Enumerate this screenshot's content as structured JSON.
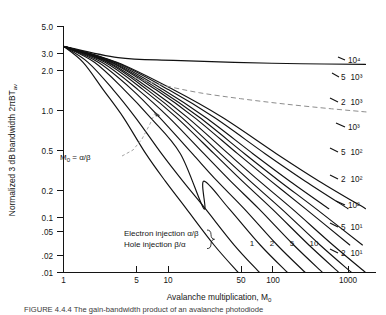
{
  "figure": {
    "caption": "FIGURE 4.4.4   The gain-bandwidth product of an avalanche photodiode",
    "background_color": "#ffffff",
    "ink_color": "#111111",
    "dash_color": "#8d8d8d"
  },
  "chart_data": {
    "type": "line",
    "title": "",
    "xlabel": "Avalanche multiplication, M",
    "xlabel_sub": "0",
    "ylabel": "Normalized 3 dB bandwidth 2πBT",
    "ylabel_sub": "av",
    "xscale": "log",
    "yscale": "log",
    "xlim": [
      1,
      1800
    ],
    "ylim": [
      0.01,
      5.0
    ],
    "grid": false,
    "legend_position": "right-of-curves",
    "xticks": [
      {
        "value": 1,
        "label": "1"
      },
      {
        "value": 5,
        "label": "5"
      },
      {
        "value": 10,
        "label": "10"
      },
      {
        "value": 50,
        "label": "50"
      },
      {
        "value": 100,
        "label": "100"
      },
      {
        "value": 1000,
        "label": "1000"
      }
    ],
    "yticks": [
      {
        "value": 5.0,
        "label": "5.0"
      },
      {
        "value": 3.0,
        "label": "3.0"
      },
      {
        "value": 2.0,
        "label": "2.0"
      },
      {
        "value": 1.0,
        "label": "1.0"
      },
      {
        "value": 0.5,
        "label": "0.5"
      },
      {
        "value": 0.2,
        "label": "0.2"
      },
      {
        "value": 0.1,
        "label": "0.1"
      },
      {
        "value": 0.05,
        "label": ".05"
      },
      {
        "value": 0.02,
        "label": ".02"
      },
      {
        "value": 0.01,
        "label": ".01"
      }
    ],
    "common_origin": {
      "x": 1,
      "y": 3.0
    },
    "series": [
      {
        "name": "k = 1",
        "label_main": "1",
        "label_sup": "",
        "label_position": "bottom",
        "points": [
          [
            1,
            3.0
          ],
          [
            1.6,
            2.0
          ],
          [
            2.6,
            1.0
          ],
          [
            4.2,
            0.5
          ],
          [
            7.2,
            0.2
          ],
          [
            11.5,
            0.1
          ],
          [
            19,
            0.05
          ],
          [
            37,
            0.02
          ],
          [
            66,
            0.01
          ]
        ]
      },
      {
        "name": "k = 2",
        "label_main": "2",
        "label_sup": "",
        "label_position": "bottom",
        "points": [
          [
            1,
            3.0
          ],
          [
            1.8,
            2.0
          ],
          [
            3.3,
            1.0
          ],
          [
            5.6,
            0.5
          ],
          [
            10.5,
            0.2
          ],
          [
            17.5,
            0.1
          ],
          [
            30,
            0.05
          ],
          [
            60,
            0.02
          ],
          [
            110,
            0.01
          ]
        ]
      },
      {
        "name": "k = 5",
        "label_main": "5",
        "label_sup": "",
        "label_position": "bottom",
        "points": [
          [
            1,
            3.0
          ],
          [
            2.1,
            2.0
          ],
          [
            4.3,
            1.0
          ],
          [
            8.0,
            0.5
          ],
          [
            16.5,
            0.2
          ],
          [
            29,
            0.05
          ],
          [
            29,
            0.1
          ],
          [
            53,
            0.05
          ],
          [
            112,
            0.02
          ],
          [
            215,
            0.01
          ]
        ]
      },
      {
        "name": "k = 10",
        "label_main": "10",
        "label_sup": "",
        "label_position": "bottom",
        "points": [
          [
            1,
            3.0
          ],
          [
            2.3,
            2.0
          ],
          [
            5.2,
            1.0
          ],
          [
            10.0,
            0.5
          ],
          [
            22,
            0.2
          ],
          [
            40,
            0.1
          ],
          [
            76,
            0.05
          ],
          [
            168,
            0.02
          ],
          [
            330,
            0.01
          ]
        ]
      },
      {
        "name": "k = 2 x 10^1",
        "label_main": "2",
        "label_sup": "10¹",
        "label_position": "right",
        "points": [
          [
            1,
            3.0
          ],
          [
            2.5,
            2.0
          ],
          [
            6.0,
            1.0
          ],
          [
            12.5,
            0.5
          ],
          [
            29,
            0.2
          ],
          [
            55,
            0.1
          ],
          [
            108,
            0.05
          ],
          [
            250,
            0.02
          ],
          [
            500,
            0.01
          ]
        ]
      },
      {
        "name": "k = 5 x 10^1",
        "label_main": "5",
        "label_sup": "10¹",
        "label_position": "right",
        "points": [
          [
            1,
            3.0
          ],
          [
            2.7,
            2.0
          ],
          [
            6.8,
            1.0
          ],
          [
            15,
            0.5
          ],
          [
            37,
            0.2
          ],
          [
            73,
            0.1
          ],
          [
            148,
            0.05
          ],
          [
            360,
            0.02
          ],
          [
            740,
            0.01
          ]
        ]
      },
      {
        "name": "k = 10^2",
        "label_main": "",
        "label_sup": "10²",
        "label_position": "right",
        "points": [
          [
            1,
            3.0
          ],
          [
            2.85,
            2.0
          ],
          [
            7.5,
            1.0
          ],
          [
            17,
            0.5
          ],
          [
            43,
            0.2
          ],
          [
            88,
            0.1
          ],
          [
            185,
            0.05
          ],
          [
            470,
            0.02
          ],
          [
            1000,
            0.01
          ]
        ]
      },
      {
        "name": "k = 2 x 10^2",
        "label_main": "2",
        "label_sup": "10²",
        "label_position": "right",
        "points": [
          [
            1,
            3.0
          ],
          [
            2.95,
            2.0
          ],
          [
            8.2,
            1.0
          ],
          [
            19.5,
            0.5
          ],
          [
            52,
            0.2
          ],
          [
            110,
            0.1
          ],
          [
            240,
            0.05
          ],
          [
            640,
            0.02
          ],
          [
            1400,
            0.01
          ]
        ]
      },
      {
        "name": "k = 5 x 10^2",
        "label_main": "5",
        "label_sup": "10²",
        "label_position": "right",
        "points": [
          [
            1,
            3.0
          ],
          [
            3.1,
            2.0
          ],
          [
            9.2,
            1.0
          ],
          [
            23,
            0.5
          ],
          [
            65,
            0.2
          ],
          [
            145,
            0.1
          ],
          [
            330,
            0.05
          ],
          [
            960,
            0.02
          ]
        ]
      },
      {
        "name": "k = 10^3",
        "label_main": "",
        "label_sup": "10³",
        "label_position": "right",
        "points": [
          [
            1,
            3.0
          ],
          [
            3.2,
            2.0
          ],
          [
            10.0,
            1.0
          ],
          [
            26,
            0.5
          ],
          [
            77,
            0.2
          ],
          [
            178,
            0.1
          ],
          [
            425,
            0.05
          ],
          [
            1300,
            0.02
          ]
        ]
      },
      {
        "name": "k = 2 x 10^3",
        "label_main": "2",
        "label_sup": "10³",
        "label_position": "right",
        "points": [
          [
            1,
            3.0
          ],
          [
            3.35,
            2.0
          ],
          [
            11.0,
            1.0
          ],
          [
            30,
            0.5
          ],
          [
            94,
            0.2
          ],
          [
            228,
            0.1
          ],
          [
            580,
            0.05
          ]
        ]
      },
      {
        "name": "k = 5 x 10^3",
        "label_main": "5",
        "label_sup": "10³",
        "label_position": "right",
        "points": [
          [
            1,
            3.0
          ],
          [
            3.5,
            2.0
          ],
          [
            12.5,
            1.0
          ],
          [
            37,
            0.5
          ],
          [
            126,
            0.2
          ],
          [
            330,
            0.1
          ],
          [
            920,
            0.05
          ]
        ]
      },
      {
        "name": "k = 10^4",
        "label_main": "",
        "label_sup": "10⁴",
        "label_position": "right",
        "points": [
          [
            1,
            3.0
          ],
          [
            3.6,
            2.0
          ],
          [
            14,
            1.0
          ],
          [
            45,
            0.5
          ],
          [
            165,
            0.2
          ],
          [
            460,
            0.1
          ],
          [
            1400,
            0.05
          ]
        ]
      },
      {
        "name": "asymptote",
        "label_main": "",
        "label_sup": "",
        "label_position": "none",
        "points": [
          [
            1,
            3.0
          ],
          [
            3.7,
            2.25
          ],
          [
            14,
            2.1
          ],
          [
            60,
            2.0
          ],
          [
            300,
            1.93
          ],
          [
            1400,
            1.9
          ]
        ]
      }
    ],
    "annotations": [
      {
        "name": "m0-annotation",
        "text": "M",
        "sub": "0",
        "text2": " = α/β",
        "x": 0.085,
        "y": 0.42
      },
      {
        "name": "electron-injection-note",
        "text": "Electron injection α/β"
      },
      {
        "name": "hole-injection-note",
        "text": "Hole injection β/α"
      }
    ],
    "dashed_locus": {
      "name": "M0 = alpha/beta locus",
      "points": [
        [
          5.5,
          1.35
        ],
        [
          11,
          1.12
        ],
        [
          26,
          0.93
        ],
        [
          70,
          0.8
        ],
        [
          200,
          0.7
        ],
        [
          620,
          0.62
        ],
        [
          1500,
          0.57
        ]
      ]
    }
  }
}
